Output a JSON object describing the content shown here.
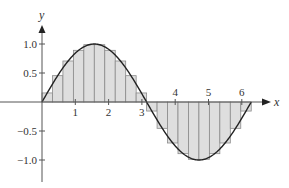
{
  "chart_data": {
    "type": "bar",
    "title": "",
    "function": "sin(x)",
    "interval": [
      0,
      6.2832
    ],
    "n_rectangles": 20,
    "rule": "midpoint",
    "xlabel": "x",
    "ylabel": "y",
    "xlim": [
      0,
      6.9
    ],
    "ylim": [
      -1.25,
      1.3
    ],
    "x_ticks": [
      1,
      2,
      3,
      4,
      5,
      6
    ],
    "x_tick_labels": [
      "1",
      "2",
      "3",
      "4",
      "5",
      "6"
    ],
    "y_ticks": [
      1.0,
      0.5,
      -0.5,
      -1.0
    ],
    "y_tick_labels": [
      "1.0",
      "0.5",
      "−0.5",
      "−1.0"
    ],
    "grid": false,
    "legend": null,
    "categories": [
      "0.157",
      "0.471",
      "0.785",
      "1.100",
      "1.414",
      "1.728",
      "2.042",
      "2.356",
      "2.670",
      "2.985",
      "3.299",
      "3.613",
      "3.927",
      "4.241",
      "4.555",
      "4.869",
      "5.184",
      "5.498",
      "5.812",
      "6.126"
    ],
    "values": [
      0.156,
      0.454,
      0.707,
      0.891,
      0.988,
      0.988,
      0.891,
      0.707,
      0.454,
      0.156,
      -0.156,
      -0.454,
      -0.707,
      -0.891,
      -0.988,
      -0.988,
      -0.891,
      -0.707,
      -0.454,
      -0.156
    ],
    "colors": {
      "fill": "#dedede",
      "rect_stroke": "#8a8a8a",
      "curve": "#222222",
      "axis": "#555555"
    }
  },
  "labels": {
    "x_axis": "x",
    "y_axis": "y",
    "xt1": "1",
    "xt2": "2",
    "xt3": "3",
    "xt4": "4",
    "xt5": "5",
    "xt6": "6",
    "yt_p10": "1.0",
    "yt_p05": "0.5",
    "yt_m05": "−0.5",
    "yt_m10": "−1.0"
  }
}
